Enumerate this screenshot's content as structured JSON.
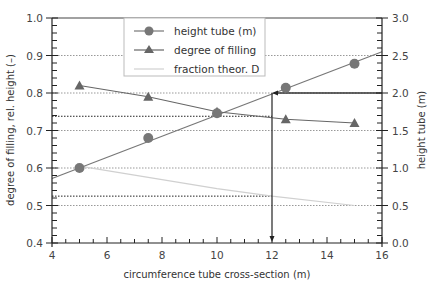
{
  "chart_data": {
    "type": "line",
    "title": "",
    "xlabel": "circumference tube cross-section (m)",
    "ylabel": "degree of filling, rel. height (–)",
    "y2label": "height tube (m)",
    "xlim": [
      4,
      16
    ],
    "ylim": [
      0.4,
      1.0
    ],
    "y2lim": [
      0.0,
      3.0
    ],
    "x_ticks": [
      4,
      6,
      8,
      10,
      12,
      14,
      16
    ],
    "x_tick_labels": [
      "4",
      "6",
      "8",
      "10",
      "12",
      "14",
      "16"
    ],
    "y_ticks": [
      0.4,
      0.5,
      0.6,
      0.7,
      0.8,
      0.9,
      1.0
    ],
    "y_tick_labels": [
      "0.4",
      "0.5",
      "0.6",
      "0.7",
      "0.8",
      "0.9",
      "1.0"
    ],
    "y2_ticks": [
      0.0,
      0.5,
      1.0,
      1.5,
      2.0,
      2.5,
      3.0
    ],
    "y2_tick_labels": [
      "0.0",
      "0.5",
      "1.0",
      "1.5",
      "2.0",
      "2.5",
      "3.0"
    ],
    "grid": "horizontal dotted at major y ticks",
    "legend_position": "upper center",
    "series": [
      {
        "name": "height tube (m)",
        "axis": "right",
        "marker": "circle",
        "color": "#777777",
        "x": [
          5,
          7.5,
          10,
          12.5,
          15
        ],
        "values": [
          1.0,
          1.4,
          1.73,
          2.07,
          2.39
        ],
        "fit_line": {
          "x": [
            4,
            16
          ],
          "y": [
            0.86,
            2.55
          ]
        }
      },
      {
        "name": "degree of filling",
        "axis": "left",
        "marker": "triangle",
        "color": "#666666",
        "x": [
          5,
          7.5,
          10,
          12.5,
          15
        ],
        "values": [
          0.82,
          0.79,
          0.75,
          0.73,
          0.72
        ]
      },
      {
        "name": "fraction theor. D",
        "axis": "left",
        "marker": "none",
        "color": "#d0d0d0",
        "x": [
          5,
          7.5,
          10,
          12,
          15
        ],
        "values": [
          0.605,
          0.575,
          0.545,
          0.525,
          0.5
        ]
      }
    ],
    "annotations": [
      {
        "type": "arrow",
        "description": "from right axis at height 2.0 horizontally left to x=12, then down to x-axis",
        "x": 12,
        "y2": 2.0
      },
      {
        "type": "hline-dotted",
        "y": 0.738,
        "from_x": 4,
        "to_x": 12
      },
      {
        "type": "hline-dotted",
        "y": 0.525,
        "from_x": 4,
        "to_x": 12
      }
    ]
  },
  "legend": {
    "items": [
      {
        "label": "height tube (m)",
        "marker": "circle"
      },
      {
        "label": "degree of filling",
        "marker": "triangle"
      },
      {
        "label": "fraction theor. D",
        "marker": "line"
      }
    ]
  },
  "axes": {
    "x_title": "circumference tube cross-section (m)",
    "y_left_title": "degree of filling, rel. height (–)",
    "y_right_title": "height tube (m)"
  }
}
